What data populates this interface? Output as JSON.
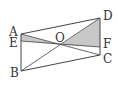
{
  "diagram": {
    "type": "geometry",
    "points": {
      "A": {
        "label": "A",
        "x": 21,
        "y": 34
      },
      "B": {
        "label": "B",
        "x": 21,
        "y": 71
      },
      "C": {
        "label": "C",
        "x": 100,
        "y": 55
      },
      "D": {
        "label": "D",
        "x": 100,
        "y": 18
      },
      "E": {
        "label": "E",
        "x": 21,
        "y": 41
      },
      "F": {
        "label": "F",
        "x": 100,
        "y": 47
      },
      "O": {
        "label": "O",
        "x": 61,
        "y": 45
      }
    },
    "colors": {
      "stroke": "#444444",
      "shade": "#c8c8c8"
    }
  }
}
